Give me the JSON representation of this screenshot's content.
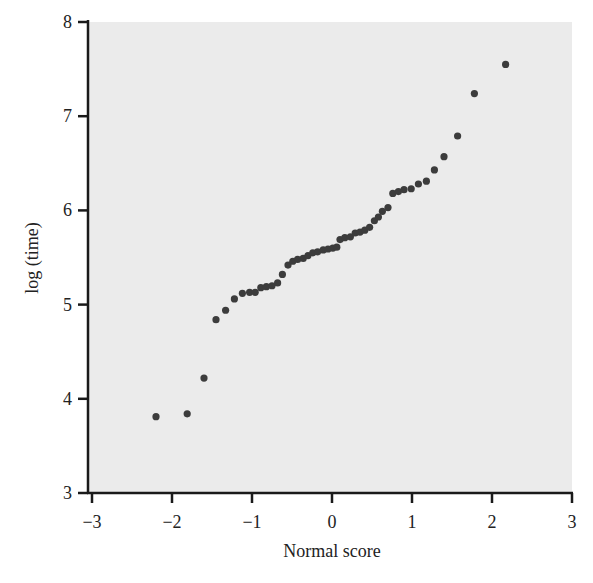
{
  "chart_data": {
    "type": "scatter",
    "title": "",
    "xlabel": "Normal score",
    "ylabel": "log (time)",
    "xlim": [
      -3,
      3
    ],
    "ylim": [
      3,
      8
    ],
    "x_ticks": [
      -3,
      -2,
      -1,
      0,
      1,
      2,
      3
    ],
    "x_tick_labels": [
      "−3",
      "−2",
      "−1",
      "0",
      "1",
      "2",
      "3"
    ],
    "y_ticks": [
      3,
      4,
      5,
      6,
      7,
      8
    ],
    "y_tick_labels": [
      "3",
      "4",
      "5",
      "6",
      "7",
      "8"
    ],
    "grid": false,
    "legend": null,
    "colors": {
      "plot_background": "#ebebeb",
      "point": "#3c3c3c",
      "axis": "#1a1a1a"
    },
    "series": [
      {
        "name": "log(time) vs normal score",
        "points": [
          [
            -2.2,
            3.81
          ],
          [
            -1.81,
            3.84
          ],
          [
            -1.6,
            4.22
          ],
          [
            -1.45,
            4.84
          ],
          [
            -1.33,
            4.94
          ],
          [
            -1.22,
            5.06
          ],
          [
            -1.12,
            5.12
          ],
          [
            -1.03,
            5.13
          ],
          [
            -0.96,
            5.13
          ],
          [
            -0.89,
            5.18
          ],
          [
            -0.82,
            5.19
          ],
          [
            -0.75,
            5.2
          ],
          [
            -0.68,
            5.23
          ],
          [
            -0.62,
            5.32
          ],
          [
            -0.55,
            5.42
          ],
          [
            -0.49,
            5.46
          ],
          [
            -0.43,
            5.48
          ],
          [
            -0.36,
            5.49
          ],
          [
            -0.3,
            5.52
          ],
          [
            -0.24,
            5.55
          ],
          [
            -0.18,
            5.56
          ],
          [
            -0.11,
            5.58
          ],
          [
            -0.05,
            5.59
          ],
          [
            0.01,
            5.6
          ],
          [
            0.06,
            5.61
          ],
          [
            0.1,
            5.69
          ],
          [
            0.16,
            5.71
          ],
          [
            0.23,
            5.72
          ],
          [
            0.29,
            5.76
          ],
          [
            0.35,
            5.77
          ],
          [
            0.41,
            5.79
          ],
          [
            0.47,
            5.82
          ],
          [
            0.53,
            5.89
          ],
          [
            0.58,
            5.93
          ],
          [
            0.63,
            5.99
          ],
          [
            0.7,
            6.03
          ],
          [
            0.76,
            6.18
          ],
          [
            0.83,
            6.2
          ],
          [
            0.9,
            6.22
          ],
          [
            0.99,
            6.23
          ],
          [
            1.08,
            6.28
          ],
          [
            1.18,
            6.31
          ],
          [
            1.28,
            6.43
          ],
          [
            1.4,
            6.57
          ],
          [
            1.57,
            6.79
          ],
          [
            1.78,
            7.24
          ],
          [
            2.17,
            7.55
          ]
        ]
      }
    ]
  }
}
